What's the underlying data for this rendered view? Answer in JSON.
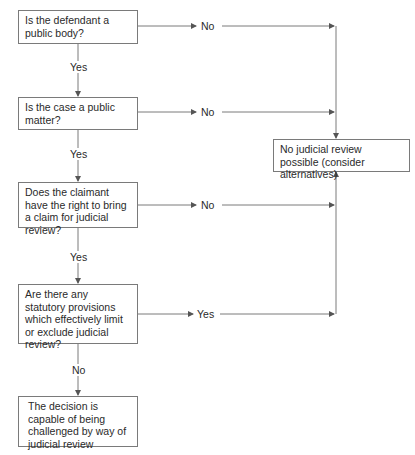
{
  "diagram": {
    "nodes": [
      {
        "id": "q1",
        "text": "Is the defendant a public body?"
      },
      {
        "id": "q2",
        "text": "Is the case a public matter?"
      },
      {
        "id": "q3",
        "text": "Does the claimant have the right to bring a claim for judicial review?"
      },
      {
        "id": "q4",
        "text": "Are there any statutory provisions which effectively limit or exclude judicial review?"
      },
      {
        "id": "result_yes",
        "text": "The decision is capable of being challenged by way of judicial review"
      },
      {
        "id": "result_no",
        "text": "No judicial review possible (consider alternatives)"
      }
    ],
    "edges": [
      {
        "from": "q1",
        "to": "q2",
        "label": "Yes"
      },
      {
        "from": "q1",
        "to": "result_no",
        "label": "No"
      },
      {
        "from": "q2",
        "to": "q3",
        "label": "Yes"
      },
      {
        "from": "q2",
        "to": "result_no",
        "label": "No"
      },
      {
        "from": "q3",
        "to": "q4",
        "label": "Yes"
      },
      {
        "from": "q3",
        "to": "result_no",
        "label": "No"
      },
      {
        "from": "q4",
        "to": "result_no",
        "label": "Yes"
      },
      {
        "from": "q4",
        "to": "result_yes",
        "label": "No"
      }
    ]
  },
  "labels": {
    "yes": "Yes",
    "no": "No"
  },
  "colors": {
    "line": "#7a7a7a",
    "text": "#2a2a2a"
  }
}
